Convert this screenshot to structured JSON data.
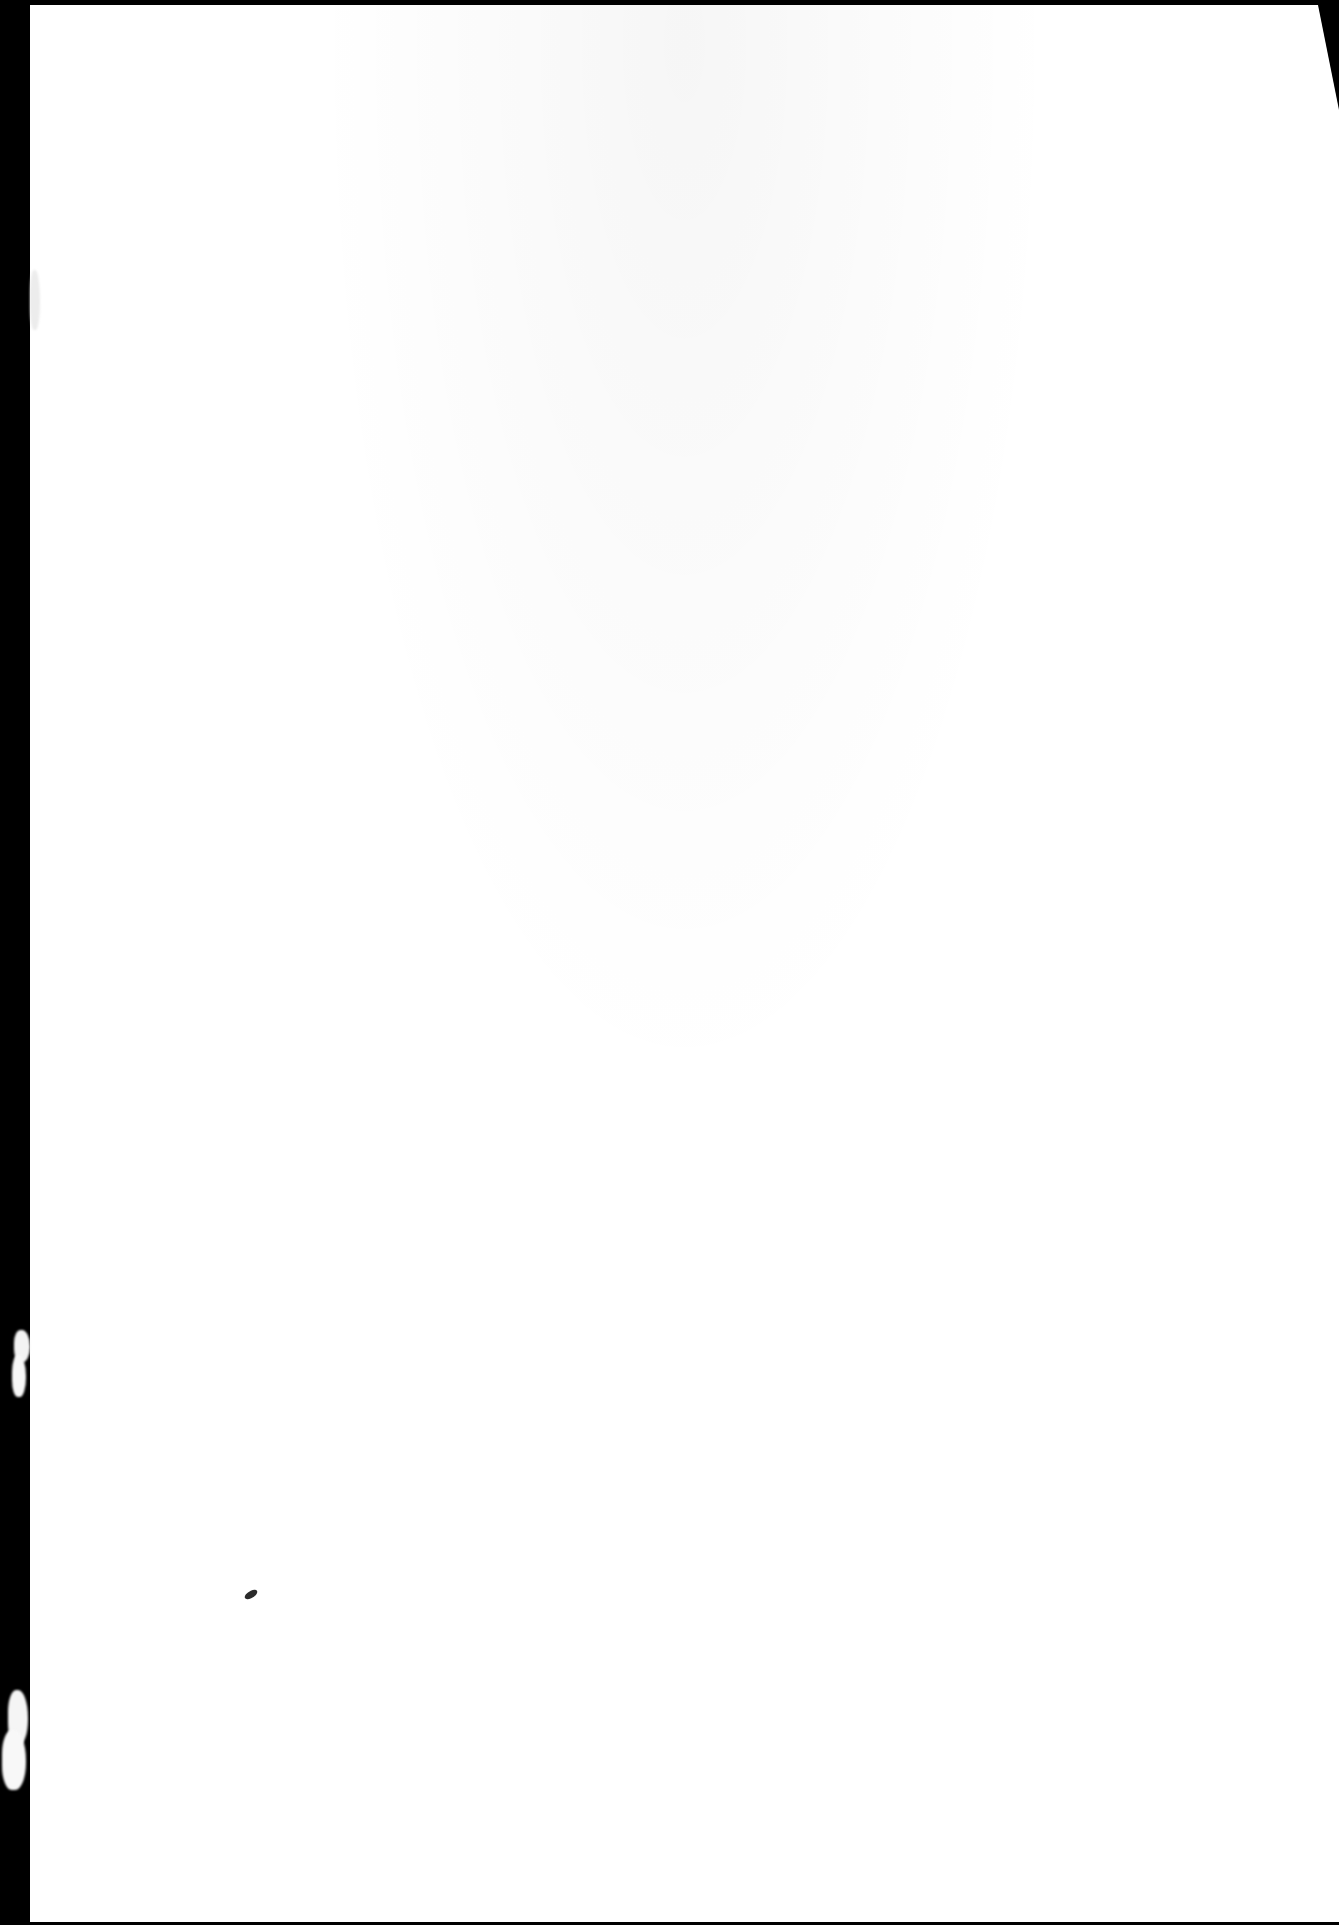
{
  "document": {
    "type": "scanned-page",
    "content": "",
    "background_color": "#ffffff",
    "border_color": "#000000",
    "features": [
      {
        "name": "left-scan-border",
        "color": "#000000"
      },
      {
        "name": "top-edge-shadow",
        "color": "#000000"
      },
      {
        "name": "top-right-corner-fold",
        "color": "#000000"
      },
      {
        "name": "ink-speck",
        "color": "#2b2b2b"
      }
    ]
  }
}
